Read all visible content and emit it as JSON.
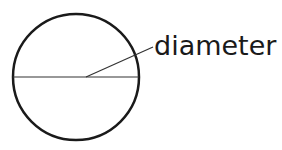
{
  "diagram": {
    "label": "diameter",
    "shape": "circle",
    "stroke_color": "#1a1a1a",
    "background": "#ffffff"
  }
}
